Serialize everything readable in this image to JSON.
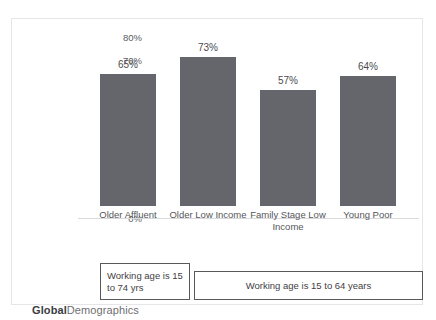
{
  "top_clipped_text": "",
  "footer": {
    "brand_bold": "Global",
    "brand_light": "Demographics"
  },
  "annotations": [
    {
      "id": "note-older-affluent",
      "text": "Working age is 15 to 74 yrs"
    },
    {
      "id": "note-other-segments",
      "text": "Working age is 15 to 64 years"
    }
  ],
  "chart_data": {
    "type": "bar",
    "title": "",
    "xlabel": "",
    "ylabel": "Percent of Working Age Population that is Employed",
    "categories": [
      "Older Affluent",
      "Older Low Income",
      "Family Stage Low Income",
      "Young Poor"
    ],
    "values": [
      65,
      73,
      57,
      64
    ],
    "data_labels": [
      "65%",
      "73%",
      "57%",
      "64%"
    ],
    "ylim": [
      0,
      80
    ],
    "ytick_values": [
      80,
      70,
      60,
      50,
      40,
      30,
      20,
      10,
      0
    ],
    "ytick_labels": [
      "80%",
      "70%",
      "60%",
      "50%",
      "40%",
      "30%",
      "20%",
      "10%",
      "0%"
    ],
    "grid": false,
    "legend": null,
    "bar_color": "#64666c",
    "axis_color": "#d9d9dc"
  }
}
